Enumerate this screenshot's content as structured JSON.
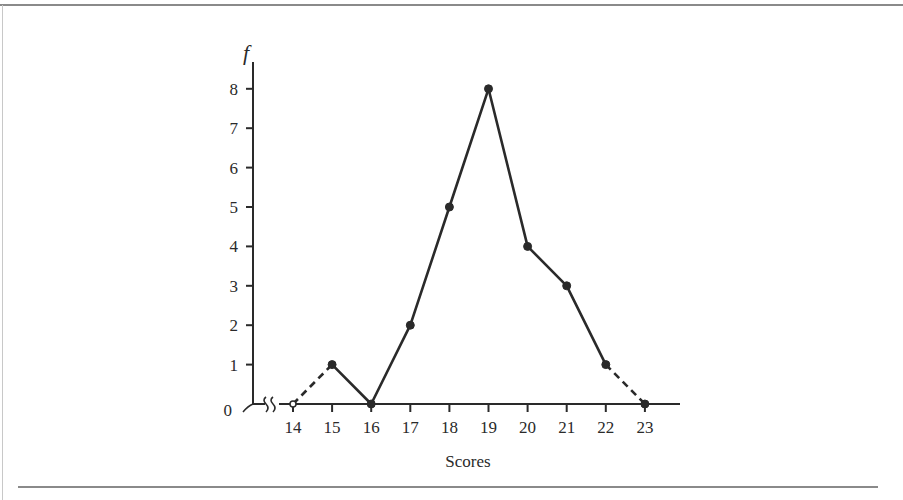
{
  "chart_data": {
    "type": "line",
    "title": "",
    "xlabel": "Scores",
    "ylabel": "f",
    "x": [
      14,
      15,
      16,
      17,
      18,
      19,
      20,
      21,
      22,
      23
    ],
    "series": [
      {
        "name": "frequency",
        "values": [
          0,
          1,
          0,
          2,
          5,
          8,
          4,
          3,
          1,
          0
        ]
      }
    ],
    "dashed_segments": [
      [
        14,
        15
      ],
      [
        22,
        23
      ]
    ],
    "xticks": [
      "14",
      "15",
      "16",
      "17",
      "18",
      "19",
      "20",
      "21",
      "22",
      "23"
    ],
    "yticks": [
      "0",
      "1",
      "2",
      "3",
      "4",
      "5",
      "6",
      "7",
      "8"
    ],
    "ylim": [
      0,
      8
    ],
    "xlim": [
      14,
      23
    ],
    "axis_break": "x-axis break between 0 and 14",
    "grid": false,
    "legend": "none"
  },
  "labels": {
    "y_axis_symbol": "f",
    "x_axis_title": "Scores"
  },
  "colors": {
    "line": "#2a2a2a",
    "frame": "#8a8a8a"
  }
}
